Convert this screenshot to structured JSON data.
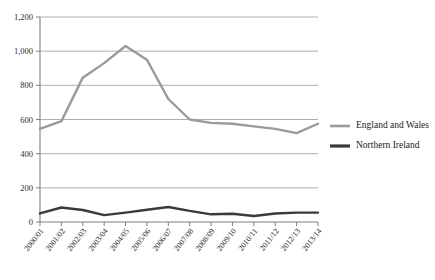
{
  "chart_data": {
    "type": "line",
    "title": "",
    "subtitle": "",
    "xlabel": "",
    "ylabel": "",
    "categories": [
      "2000/01",
      "2001/02",
      "2002/03",
      "2003/04",
      "2004/05",
      "2005/06",
      "2006/07",
      "2007/08",
      "2008/09",
      "2009/10",
      "2010/11",
      "2011/12",
      "2012/13",
      "2013/14"
    ],
    "series": [
      {
        "name": "England and Wales",
        "color": "#9a9a9a",
        "values": [
          545,
          590,
          845,
          930,
          1030,
          950,
          720,
          600,
          580,
          575,
          560,
          545,
          520,
          575
        ]
      },
      {
        "name": "Northern Ireland",
        "color": "#3a3a3a",
        "values": [
          50,
          85,
          70,
          40,
          55,
          72,
          88,
          65,
          45,
          48,
          35,
          50,
          55,
          55
        ]
      }
    ],
    "ylim": [
      0,
      1200
    ],
    "yticks": [
      0,
      200,
      400,
      600,
      800,
      1000,
      1200
    ],
    "ytick_labels": [
      "0",
      "200",
      "400",
      "600",
      "800",
      "1,000",
      "1,200"
    ],
    "grid": "horizontal",
    "legend_position": "right",
    "axis_color": "#808080",
    "grid_color": "#a6a6a6"
  },
  "legend": {
    "items": [
      {
        "label": "England and Wales",
        "color": "#9a9a9a"
      },
      {
        "label": "Northern Ireland",
        "color": "#3a3a3a"
      }
    ]
  }
}
